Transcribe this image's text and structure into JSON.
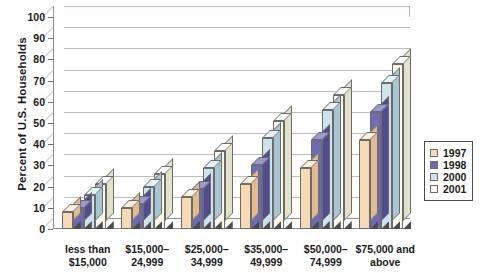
{
  "chart_data": {
    "type": "bar",
    "title": "",
    "xlabel": "",
    "ylabel": "Percent of U.S. Households",
    "ylim": [
      0,
      100
    ],
    "ytick_labels": [
      "0",
      "10",
      "20",
      "30",
      "40",
      "50",
      "60",
      "70",
      "80",
      "90",
      "100"
    ],
    "ytick_values": [
      0,
      10,
      20,
      30,
      40,
      50,
      60,
      70,
      80,
      90,
      100
    ],
    "grid": true,
    "legend_position": "right",
    "style": "3d-grouped-column",
    "categories": [
      "less than\n$15,000",
      "$15,000–\n24,999",
      "$25,000–\n34,999",
      "$35,000–\n49,999",
      "$50,000–\n74,999",
      "$75,000 and\nabove"
    ],
    "series": [
      {
        "name": "1997",
        "color": "#f7d9b4",
        "values": [
          8,
          10,
          15,
          21,
          29,
          42
        ]
      },
      {
        "name": "1998",
        "color": "#6f6ab4",
        "values": [
          10,
          12,
          19,
          30,
          42,
          55
        ]
      },
      {
        "name": "2000",
        "color": "#cde3ec",
        "values": [
          16,
          20,
          29,
          43,
          56,
          69
        ]
      },
      {
        "name": "2001",
        "color": "#fbfaec",
        "values": [
          21,
          26,
          37,
          51,
          63,
          78
        ]
      }
    ]
  },
  "legend": {
    "items": [
      {
        "label": "1997",
        "color": "#f7d9b4"
      },
      {
        "label": "1998",
        "color": "#6f6ab4"
      },
      {
        "label": "2000",
        "color": "#cde3ec"
      },
      {
        "label": "2001",
        "color": "#fbfaec"
      }
    ]
  }
}
